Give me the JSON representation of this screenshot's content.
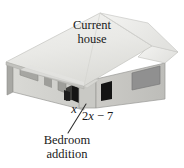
{
  "figure": {
    "width": 184,
    "height": 168,
    "background": "#ffffff"
  },
  "labels": {
    "current_house_line1": "Current",
    "current_house_line2": "house",
    "bedroom_addition_line1": "Bedroom",
    "bedroom_addition_line2": "addition",
    "side_x": "x",
    "side_expression_prefix": "2",
    "side_expression_var": "x",
    "side_expression_suffix": " − 7",
    "side_expression_full": "2x − 7"
  },
  "colors": {
    "roof_light": "#ededea",
    "roof_mid": "#e0e0dd",
    "roof_shadow": "#cfcfcb",
    "wall_front_light": "#d6d6d2",
    "wall_front_mid": "#c4c4c0",
    "wall_side_dark": "#b0b0ac",
    "wall_side_darker": "#9d9d99",
    "window_gray": "#8f8f8b",
    "opening_black": "#141414",
    "outline": "#6b6b67",
    "text": "#1a1a1a",
    "leader_line": "#3a3a3a"
  },
  "geometry": {
    "roof_apex": [
      100,
      13
    ],
    "roof_left_eave": [
      6,
      62
    ],
    "roof_right_eave": [
      178,
      52
    ],
    "ground_line_y": 108
  },
  "parts": [
    {
      "name": "hip-roof-main",
      "kind": "roof"
    },
    {
      "name": "left-wing-front-wall",
      "kind": "wall"
    },
    {
      "name": "left-wing-side-wall",
      "kind": "wall"
    },
    {
      "name": "addition-front-wall",
      "kind": "wall"
    },
    {
      "name": "addition-side-wall",
      "kind": "wall"
    },
    {
      "name": "addition-gable-roof",
      "kind": "roof"
    },
    {
      "name": "left-window-1",
      "kind": "window"
    },
    {
      "name": "left-window-2",
      "kind": "window"
    },
    {
      "name": "left-window-3",
      "kind": "window"
    },
    {
      "name": "corner-opening",
      "kind": "opening"
    },
    {
      "name": "door-opening",
      "kind": "opening"
    },
    {
      "name": "addition-window-small",
      "kind": "opening"
    },
    {
      "name": "addition-window-large",
      "kind": "window"
    }
  ]
}
